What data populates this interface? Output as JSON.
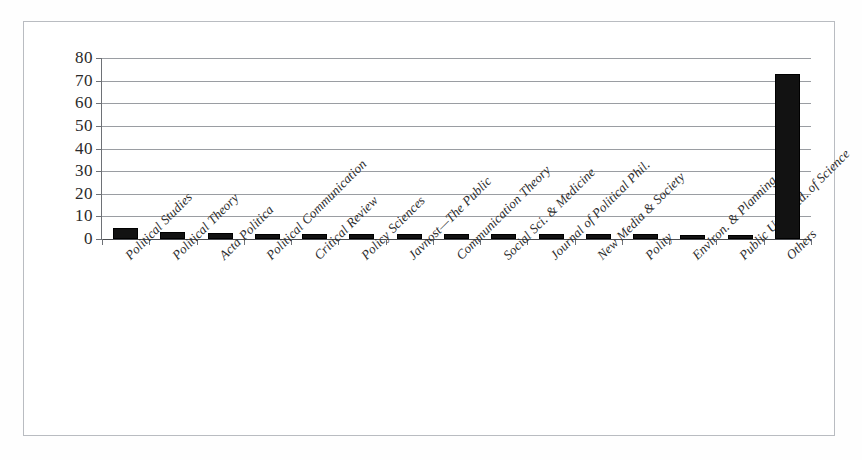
{
  "figure": {
    "frame_color": "#b9bcc1",
    "bar_color": "#121212",
    "gridline_color": "#9a9da2",
    "axis_color": "#6e7176"
  },
  "chart_data": {
    "type": "bar",
    "title": "",
    "subtitle": "",
    "xlabel": "",
    "ylabel": "",
    "ylim": [
      0,
      80
    ],
    "yticks": [
      0,
      10,
      20,
      30,
      40,
      50,
      60,
      70,
      80
    ],
    "ytick_labels": [
      "0",
      "10",
      "20",
      "30",
      "40",
      "50",
      "60",
      "70",
      "80"
    ],
    "grid": true,
    "legend": false,
    "xtick_rotation": -45,
    "categories": [
      "Political Studies",
      "Political Theory",
      "Acta Politica",
      "Political Communication",
      "Critical Review",
      "Policy Sciences",
      "Javnost—The Public",
      "Communication Theory",
      "Social Sci. & Medicine",
      "Journal of Political Phil.",
      "New Media & Society",
      "Polity",
      "Environ. & Planning",
      "Public Understd. of Science",
      "Others"
    ],
    "values": [
      5,
      3,
      2.6,
      2.2,
      2.2,
      2.2,
      2.2,
      2.1,
      2.1,
      2,
      2,
      2,
      1.6,
      1.6,
      73
    ]
  },
  "caption": {
    "text": ""
  }
}
